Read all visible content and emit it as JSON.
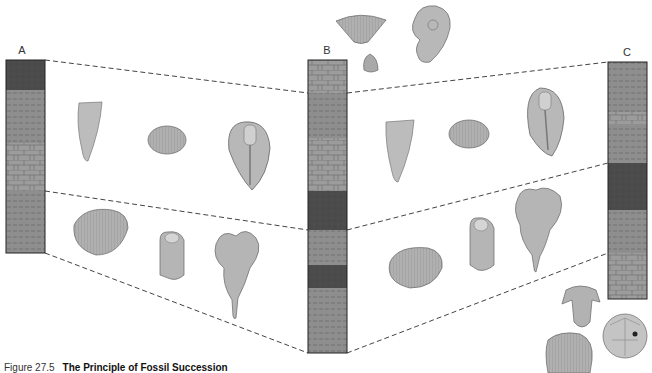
{
  "figure": {
    "caption_number": "Figure 27.5",
    "caption_title": "The Principle of Fossil Succession"
  },
  "columns": [
    {
      "label": "A",
      "layers_top_to_bottom": [
        "dark-shale",
        "shale",
        "limestone",
        "shale"
      ]
    },
    {
      "label": "B",
      "layers_top_to_bottom": [
        "limestone",
        "shale",
        "limestone",
        "dark-shale",
        "shale",
        "dark-shale",
        "shale"
      ]
    },
    {
      "label": "C",
      "layers_top_to_bottom": [
        "shale",
        "limestone",
        "shale",
        "dark-shale",
        "shale",
        "limestone"
      ]
    }
  ],
  "correlation_lines": [
    {
      "from": "A",
      "to": "B",
      "horizon": "upper"
    },
    {
      "from": "A",
      "to": "B",
      "horizon": "middle"
    },
    {
      "from": "A",
      "to": "B",
      "horizon": "lower"
    },
    {
      "from": "B",
      "to": "C",
      "horizon": "upper"
    },
    {
      "from": "B",
      "to": "C",
      "horizon": "middle"
    },
    {
      "from": "B",
      "to": "C",
      "horizon": "lower"
    }
  ],
  "fossil_groups": {
    "top_unique_to_B": [
      "brachiopod-spirifer",
      "ammonite",
      "clam-small"
    ],
    "upper_zone_AB": [
      "horn-coral",
      "brachiopod",
      "trilobite-large"
    ],
    "lower_zone_AB": [
      "clam",
      "trilobite-small",
      "crinoid"
    ],
    "upper_zone_BC": [
      "horn-coral",
      "brachiopod",
      "trilobite-large"
    ],
    "lower_zone_BC": [
      "clam",
      "trilobite-small",
      "crinoid"
    ],
    "bottom_unique_to_C": [
      "trilobite-spiny",
      "brachiopod-ribbed",
      "cystoid"
    ]
  },
  "colors": {
    "shale": "#8c8c8c",
    "dark_shale": "#4a4a4a",
    "limestone": "#9a9a9a",
    "fossil_fill": "#b5b5b5",
    "line": "#444444"
  }
}
